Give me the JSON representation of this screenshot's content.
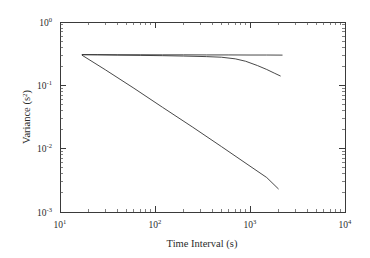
{
  "figure": {
    "background_color": "#ffffff",
    "axis_color": "#3a3a3a",
    "line_color": "#333333"
  },
  "axes": {
    "x_title": "Time Interval (s)",
    "y_title_main": "Variance (s",
    "y_title_sup": "2",
    "y_title_close": ")",
    "x_tick_labels": [
      {
        "mantissa": "10",
        "exponent": "1"
      },
      {
        "mantissa": "10",
        "exponent": "2"
      },
      {
        "mantissa": "10",
        "exponent": "3"
      },
      {
        "mantissa": "10",
        "exponent": "4"
      }
    ],
    "y_tick_labels": [
      {
        "mantissa": "10",
        "exponent": "0"
      },
      {
        "mantissa": "10",
        "exponent": "-1"
      },
      {
        "mantissa": "10",
        "exponent": "-2"
      },
      {
        "mantissa": "10",
        "exponent": "-3"
      }
    ]
  },
  "chart_data": {
    "type": "line",
    "title": "",
    "xlabel": "Time Interval (s)",
    "ylabel": "Variance (s^2)",
    "xscale": "log",
    "yscale": "log",
    "xlim": [
      10,
      10000
    ],
    "ylim": [
      0.001,
      1
    ],
    "grid": false,
    "legend": "none",
    "series": [
      {
        "name": "flat-variance",
        "x": [
          17,
          25,
          40,
          70,
          120,
          200,
          350,
          600,
          1000,
          1500,
          2200
        ],
        "y": [
          0.305,
          0.305,
          0.304,
          0.304,
          0.303,
          0.303,
          0.302,
          0.302,
          0.301,
          0.301,
          0.3
        ]
      },
      {
        "name": "slow-decay-variance",
        "x": [
          17,
          25,
          40,
          70,
          120,
          200,
          350,
          500,
          700,
          900,
          1200,
          1500,
          1800,
          2100
        ],
        "y": [
          0.305,
          0.303,
          0.3,
          0.297,
          0.294,
          0.29,
          0.284,
          0.278,
          0.262,
          0.24,
          0.205,
          0.178,
          0.156,
          0.14
        ]
      },
      {
        "name": "power-law-variance",
        "x": [
          17,
          30,
          60,
          120,
          250,
          500,
          1000,
          1500,
          2000
        ],
        "y": [
          0.3,
          0.176,
          0.09,
          0.045,
          0.0218,
          0.0108,
          0.0053,
          0.0035,
          0.0023
        ]
      }
    ]
  }
}
